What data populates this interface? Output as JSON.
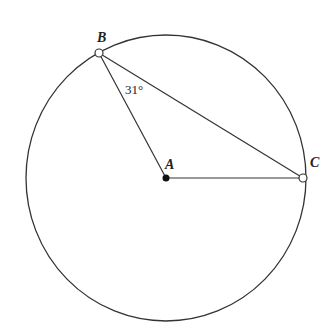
{
  "diagram": {
    "type": "circle-geometry",
    "points": {
      "A": {
        "label": "A",
        "role": "center",
        "x": 166,
        "y": 178
      },
      "B": {
        "label": "B",
        "role": "on-circle",
        "x": 99,
        "y": 53
      },
      "C": {
        "label": "C",
        "role": "on-circle",
        "x": 303,
        "y": 178
      }
    },
    "segments": [
      "AB",
      "BC",
      "AC"
    ],
    "angle_label": "31°",
    "angle_at": "B",
    "colors": {
      "stroke": "#333333",
      "background": "#ffffff"
    }
  }
}
